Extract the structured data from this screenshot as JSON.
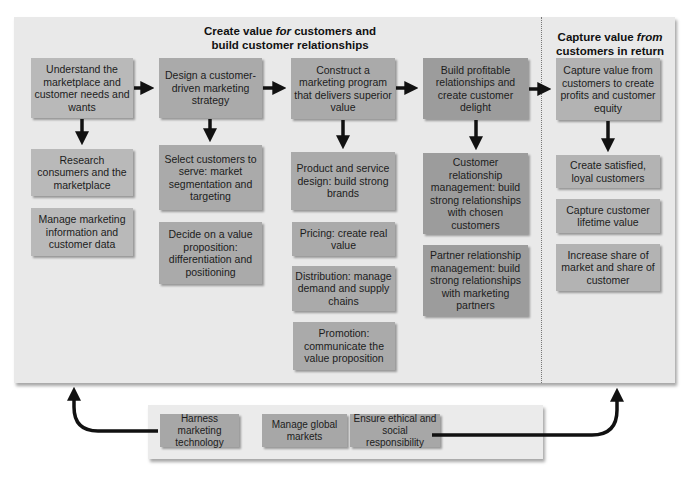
{
  "sections": {
    "create_value": {
      "heading_line1_pre": "Create value ",
      "heading_line1_em": "for",
      "heading_line1_post": " customers and",
      "heading_line2": "build customer relationships"
    },
    "capture_value": {
      "heading_line1_pre": "Capture value ",
      "heading_line1_em": "from",
      "heading_line2": "customers in return"
    }
  },
  "columns": [
    {
      "step": "Understand the marketplace and customer needs and wants",
      "sub_items": [
        "Research consumers and the marketplace",
        "Manage marketing information and customer data"
      ]
    },
    {
      "step": "Design a customer-driven marketing strategy",
      "sub_items": [
        "Select customers to serve: market segmentation and targeting",
        "Decide on a value proposition: differentiation and positioning"
      ]
    },
    {
      "step": "Construct a marketing program that delivers superior value",
      "sub_items": [
        "Product and service design: build strong brands",
        "Pricing: create real value",
        "Distribution: manage demand and supply chains",
        "Promotion: communicate the value proposition"
      ]
    },
    {
      "step": "Build profitable relationships and create customer delight",
      "sub_items": [
        "Customer relationship management: build strong relationships with chosen customers",
        "Partner relationship management: build strong relationships with marketing partners"
      ]
    },
    {
      "step": "Capture value from customers to create profits and customer equity",
      "sub_items": [
        "Create satisfied, loyal customers",
        "Capture customer lifetime value",
        "Increase share of market and share of customer"
      ]
    }
  ],
  "bottom_factors": [
    "Harness marketing technology",
    "Manage global markets",
    "Ensure ethical and social responsibility"
  ],
  "colors": {
    "panel_bg": "#e9e9e9",
    "box_light": "#b9b9b9",
    "box_mid": "#aaaaaa",
    "box_dark": "#9c9c9c",
    "arrow": "#111111"
  }
}
